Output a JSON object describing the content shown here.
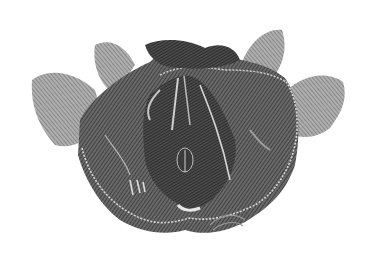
{
  "image": {
    "subject": "anatomical engraving of pelvic floor (inferior view)",
    "style": "monochrome cross-hatched engraving",
    "background": "#ffffff",
    "colors": {
      "dark": "#3a3a3a",
      "mid": "#5a5a5a",
      "light": "#8a8a8a",
      "highlight": "#d8d8d8"
    }
  }
}
